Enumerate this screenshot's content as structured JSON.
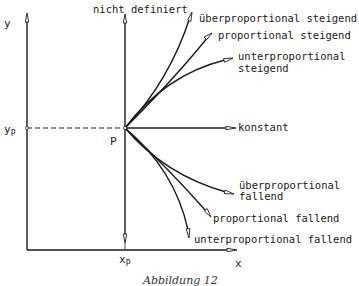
{
  "axes": {
    "y_label": "y",
    "x_label": "x",
    "yp_label": "y",
    "yp_sub": "P",
    "xp_label": "x",
    "xp_sub": "P",
    "point_label": "P"
  },
  "labels": {
    "undefined": "nicht definiert",
    "over_rising": "überproportional steigend",
    "prop_rising": "proportional steigend",
    "under_rising_1": "unterproportional",
    "under_rising_2": "steigend",
    "constant": "konstant",
    "over_falling_1": "überproportional",
    "over_falling_2": "fallend",
    "prop_falling": "proportional fallend",
    "under_falling": "unterproportional fallend"
  },
  "caption": "Abbildung 12",
  "colors": {
    "line": "#1a1a1a",
    "background": "#ffffff"
  }
}
